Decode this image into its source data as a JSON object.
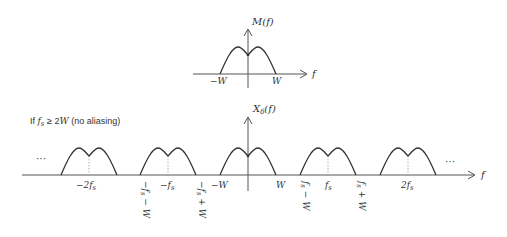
{
  "top_plot": {
    "ylabel": "M(f)",
    "xlabel": "f",
    "ticks": {
      "neg": "−W",
      "pos": "W"
    }
  },
  "bottom_plot": {
    "condition": "If f_s ≥ 2W (no aliasing)",
    "condition_parts": {
      "pre": "If ",
      "fs": "f",
      "sub": "s",
      "rel": " ≥ 2",
      "W": "W",
      "post": " (no aliasing)"
    },
    "ylabel": "X_δ(f)",
    "ylabel_parts": {
      "X": "X",
      "sub": "δ",
      "arg": "(f)"
    },
    "xlabel": "f",
    "ellipsis_left": "···",
    "ellipsis_right": "···",
    "center_labels": {
      "minus_2fs": "−2f_s",
      "minus_fs": "−f_s",
      "fs": "f_s",
      "two_fs": "2f_s"
    },
    "edge_labels": {
      "neg_w": "−W",
      "pos_w": "W",
      "minus_fs_minus_w": "−f_s − W",
      "minus_fs_plus_w": "−f_s + W",
      "fs_minus_w": "f_s − W",
      "fs_plus_w": "f_s + W"
    }
  },
  "colors": {
    "stroke": "#333333",
    "dotted": "#999999"
  }
}
